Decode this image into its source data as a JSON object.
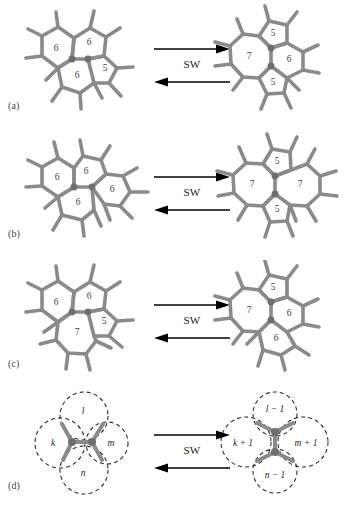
{
  "figure": {
    "transformation_label": "SW",
    "panels": [
      {
        "id": "a",
        "label": "(a)",
        "left": {
          "name": "six-six-six-five-cluster",
          "bond_orientation": "horizontal",
          "rings": {
            "top": "6",
            "left": "6",
            "right": "5",
            "bottom": "6"
          }
        },
        "right": {
          "name": "five-seven-six-five-cluster",
          "bond_orientation": "vertical",
          "rings": {
            "top": "5",
            "left": "7",
            "right": "6",
            "bottom": "5"
          }
        }
      },
      {
        "id": "b",
        "label": "(b)",
        "left": {
          "name": "all-hexagon-pyrene-cluster",
          "bond_orientation": "horizontal",
          "rings": {
            "top": "6",
            "left": "6",
            "right": "6",
            "bottom": "6"
          }
        },
        "right": {
          "name": "five-seven-seven-five-defect",
          "bond_orientation": "vertical",
          "rings": {
            "top": "5",
            "left": "7",
            "right": "7",
            "bottom": "5"
          }
        }
      },
      {
        "id": "c",
        "label": "(c)",
        "left": {
          "name": "six-six-five-seven-cluster",
          "bond_orientation": "horizontal",
          "rings": {
            "top": "6",
            "left": "6",
            "right": "5",
            "bottom": "7"
          }
        },
        "right": {
          "name": "five-seven-six-six-cluster",
          "bond_orientation": "vertical",
          "rings": {
            "top": "5",
            "left": "7",
            "right": "6",
            "bottom": "6"
          }
        }
      },
      {
        "id": "d",
        "label": "(d)",
        "left": {
          "name": "generic-klmn-cluster",
          "bond_orientation": "horizontal",
          "rings": {
            "top": "l",
            "left": "k",
            "right": "m",
            "bottom": "n"
          }
        },
        "right": {
          "name": "generic-transformed-cluster",
          "bond_orientation": "vertical",
          "rings": {
            "top": "l − 1",
            "left": "k + 1",
            "right": "m + 1",
            "bottom": "n − 1"
          }
        }
      }
    ]
  },
  "style": {
    "bond_color": "#8a8a8a",
    "vertex_color": "#6e6e6e",
    "arrow_color": "#000000",
    "dashed_color": "#2b2b2b",
    "background": "#ffffff"
  }
}
